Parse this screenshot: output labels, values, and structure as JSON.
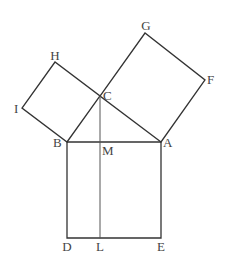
{
  "diagram": {
    "points": {
      "A": "A",
      "B": "B",
      "C": "C",
      "D": "D",
      "E": "E",
      "F": "F",
      "G": "G",
      "H": "H",
      "I": "I",
      "L": "L",
      "M": "M"
    },
    "squares": [
      {
        "name": "square-ACGF",
        "vertices": [
          "A",
          "C",
          "G",
          "F"
        ]
      },
      {
        "name": "square-BCHI",
        "vertices": [
          "B",
          "C",
          "H",
          "I"
        ]
      },
      {
        "name": "square-BDEA",
        "vertices": [
          "B",
          "D",
          "E",
          "A"
        ]
      }
    ],
    "segments": [
      [
        "C",
        "L"
      ]
    ],
    "colors": {
      "line": "#333333",
      "label": "#444444",
      "background": "#ffffff"
    }
  }
}
